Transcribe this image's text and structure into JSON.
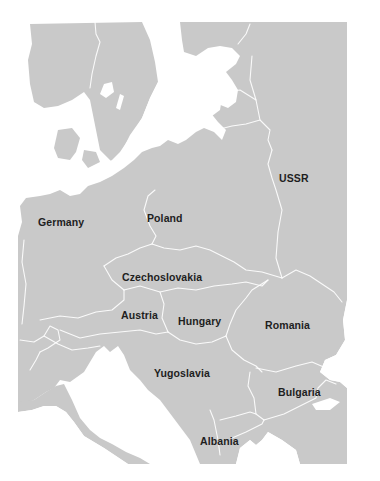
{
  "map": {
    "title": "",
    "land_color": "#c9c9c9",
    "water_color": "#ffffff",
    "border_color": "#ffffff",
    "label_color": "#1e1e1e",
    "labels": [
      {
        "name": "Germany",
        "x": 38,
        "y": 216
      },
      {
        "name": "Poland",
        "x": 147,
        "y": 212
      },
      {
        "name": "USSR",
        "x": 279,
        "y": 172
      },
      {
        "name": "Czechoslovakia",
        "x": 122,
        "y": 271
      },
      {
        "name": "Austria",
        "x": 121,
        "y": 309
      },
      {
        "name": "Hungary",
        "x": 178,
        "y": 315
      },
      {
        "name": "Romania",
        "x": 265,
        "y": 319
      },
      {
        "name": "Yugoslavia",
        "x": 154,
        "y": 367
      },
      {
        "name": "Bulgaria",
        "x": 278,
        "y": 386
      },
      {
        "name": "Albania",
        "x": 200,
        "y": 435
      }
    ]
  }
}
